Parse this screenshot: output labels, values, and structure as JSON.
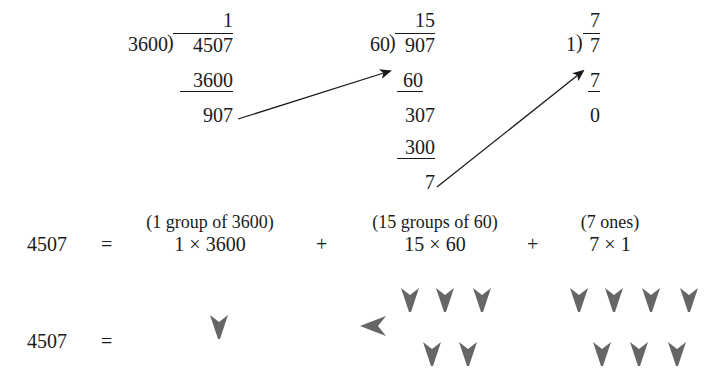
{
  "divisions": [
    {
      "quotient": "1",
      "divisor": "3600",
      "dividend": "4507",
      "subtract": "3600",
      "remainder": "907"
    },
    {
      "quotient": "15",
      "divisor": "60",
      "dividend": "907",
      "subtract1": "60",
      "partial": "307",
      "subtract2": "300",
      "remainder": "7"
    },
    {
      "quotient": "7",
      "divisor": "1",
      "dividend": "7",
      "subtract": "7",
      "remainder": "0"
    }
  ],
  "expansion": {
    "lhs": "4507",
    "equals": "=",
    "terms": [
      {
        "label": "(1 group of 3600)",
        "expr": "1 × 3600"
      },
      {
        "label": "(15 groups of 60)",
        "expr": "15 × 60"
      },
      {
        "label": "(7 ones)",
        "expr": "7 × 1"
      }
    ],
    "plus": "+"
  },
  "babylonian": {
    "lhs": "4507",
    "equals": "=",
    "digits": [
      {
        "value": 1,
        "units": 1,
        "tens": 0
      },
      {
        "value": 15,
        "units": 5,
        "tens": 1
      },
      {
        "value": 7,
        "units": 7,
        "tens": 0
      }
    ],
    "wedge_color": "#666666"
  }
}
